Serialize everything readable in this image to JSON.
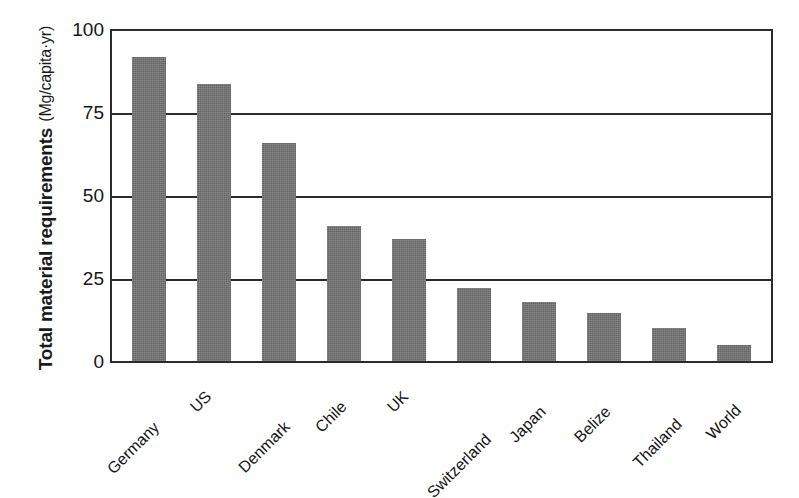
{
  "chart_data": {
    "type": "bar",
    "title": "",
    "xlabel": "",
    "ylabel": "Total material requirements (Mg/capita·yr)",
    "ylabel_line1": "Total material requirements",
    "ylabel_line2": "(Mg/capita·yr)",
    "categories": [
      "Germany",
      "US",
      "Denmark",
      "Chile",
      "UK",
      "Switzerland",
      "Japan",
      "Belize",
      "Thailand",
      "World"
    ],
    "values": [
      92,
      84,
      66,
      41,
      37,
      22,
      18,
      14.5,
      10,
      5
    ],
    "ylim": [
      0,
      100
    ],
    "yticks": [
      0,
      25,
      50,
      75,
      100
    ],
    "ytick_labels": [
      "0",
      "25",
      "50",
      "75",
      "100"
    ],
    "grid": true,
    "grid_axis": "y",
    "legend": false,
    "bar_color": "#6f6f6f",
    "axis_color": "#2b2b2b",
    "background": "#ffffff"
  },
  "axis": {
    "ticks": [
      {
        "label": "100",
        "value": 100
      },
      {
        "label": "75",
        "value": 75
      },
      {
        "label": "50",
        "value": 50
      },
      {
        "label": "25",
        "value": 25
      },
      {
        "label": "0",
        "value": 0
      }
    ]
  }
}
